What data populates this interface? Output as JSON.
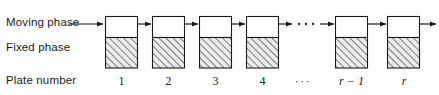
{
  "figure": {
    "background_color": "#ffffff",
    "line_color": "#1a1a1a",
    "hatch_color": "#555555",
    "hatch_fill": "#e9e9e9",
    "width": 439,
    "height": 95
  },
  "row_labels": {
    "moving_phase": "Moving phase",
    "fixed_phase": "Fixed phase",
    "plate_number": "Plate number"
  },
  "plates": [
    {
      "label": "1",
      "italic": false,
      "x": 121.5
    },
    {
      "label": "2",
      "italic": false,
      "x": 168.5
    },
    {
      "label": "3",
      "italic": false,
      "x": 215.5
    },
    {
      "label": "4",
      "italic": false,
      "x": 262.5
    },
    {
      "label": "···",
      "italic": false,
      "x": 303.0,
      "is_dots": true
    },
    {
      "label": "r − 1",
      "italic": true,
      "x": 351.5
    },
    {
      "label": "r",
      "italic": true,
      "x": 404.0
    }
  ],
  "boxes": [
    {
      "x": 105,
      "y": 16,
      "w": 33,
      "h": 52,
      "moving_h": 21,
      "fixed_h": 31
    },
    {
      "x": 152,
      "y": 16,
      "w": 33,
      "h": 52,
      "moving_h": 21,
      "fixed_h": 31
    },
    {
      "x": 199,
      "y": 16,
      "w": 33,
      "h": 52,
      "moving_h": 21,
      "fixed_h": 31
    },
    {
      "x": 246,
      "y": 16,
      "w": 33,
      "h": 52,
      "moving_h": 21,
      "fixed_h": 31
    },
    {
      "x": 335,
      "y": 16,
      "w": 33,
      "h": 52,
      "moving_h": 21,
      "fixed_h": 31
    },
    {
      "x": 387,
      "y": 16,
      "w": 33,
      "h": 52,
      "moving_h": 21,
      "fixed_h": 31
    }
  ],
  "arrows": [
    {
      "name": "moving-phase-inlet-arrow",
      "x1": 69,
      "x2": 104,
      "y": 24
    },
    {
      "name": "flow-arrow-1-2",
      "x1": 138,
      "x2": 151,
      "y": 24
    },
    {
      "name": "flow-arrow-2-3",
      "x1": 185,
      "x2": 198,
      "y": 24
    },
    {
      "name": "flow-arrow-3-4",
      "x1": 232,
      "x2": 245,
      "y": 24
    },
    {
      "name": "flow-arrow-4-gap",
      "x1": 279,
      "x2": 293,
      "y": 24
    },
    {
      "name": "flow-arrow-gap-r1",
      "x1": 320,
      "x2": 334,
      "y": 24
    },
    {
      "name": "flow-arrow-r1-r",
      "x1": 368,
      "x2": 386,
      "y": 24
    },
    {
      "name": "flow-arrow-outlet",
      "x1": 420,
      "x2": 436,
      "y": 24
    }
  ],
  "gap_ellipsis": {
    "name": "flow-gap-ellipsis",
    "dots": [
      {
        "x": 299,
        "y": 24
      },
      {
        "x": 306,
        "y": 24
      },
      {
        "x": 313,
        "y": 24
      }
    ],
    "radius": 1.1
  },
  "moving_phase_label_arrow": {
    "shaft_from_x": 69,
    "shaft_to_x": 104,
    "y": 24
  }
}
